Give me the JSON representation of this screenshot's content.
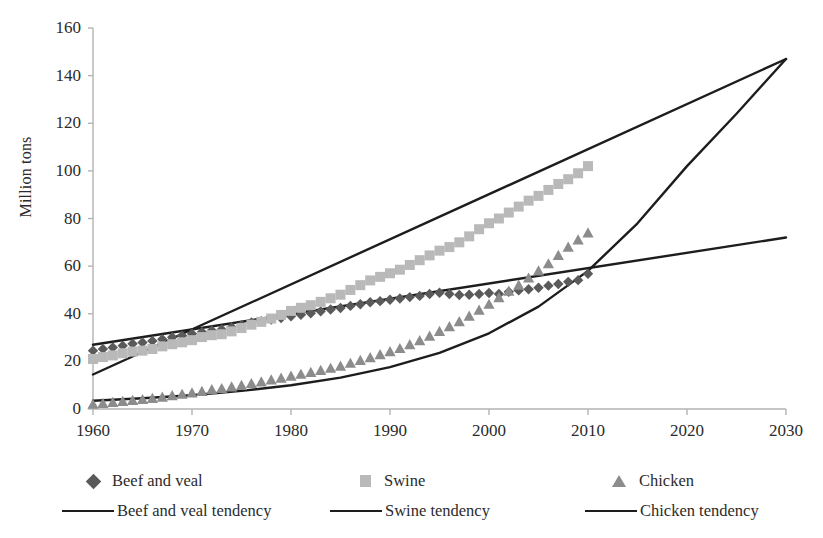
{
  "chart_data": {
    "type": "line",
    "title": "",
    "xlabel": "",
    "ylabel": "Million tons",
    "xlim": [
      1960,
      2030
    ],
    "ylim": [
      0,
      160
    ],
    "xticks": [
      1960,
      1970,
      1980,
      1990,
      2000,
      2010,
      2020,
      2030
    ],
    "yticks": [
      0,
      20,
      40,
      60,
      80,
      100,
      120,
      140,
      160
    ],
    "grid": false,
    "legend_position": "bottom",
    "colors": {
      "beef_marker": "#5a5a5a",
      "swine_marker": "#b9b9b9",
      "chicken_marker": "#8c8c8c",
      "tendency_line": "#1d1d1d",
      "axis": "#b3b3b3",
      "text": "#2b2b2b",
      "background": "#ffffff"
    },
    "x": [
      1960,
      1961,
      1962,
      1963,
      1964,
      1965,
      1966,
      1967,
      1968,
      1969,
      1970,
      1971,
      1972,
      1973,
      1974,
      1975,
      1976,
      1977,
      1978,
      1979,
      1980,
      1981,
      1982,
      1983,
      1984,
      1985,
      1986,
      1987,
      1988,
      1989,
      1990,
      1991,
      1992,
      1993,
      1994,
      1995,
      1996,
      1997,
      1998,
      1999,
      2000,
      2001,
      2002,
      2003,
      2004,
      2005,
      2006,
      2007,
      2008,
      2009,
      2010
    ],
    "series": [
      {
        "name": "Beef and veal",
        "marker": "diamond",
        "color": "#5a5a5a",
        "values": [
          24.5,
          25.2,
          25.8,
          26.6,
          27.4,
          27.9,
          28.6,
          29.3,
          30.1,
          30.8,
          31.6,
          32.3,
          33.0,
          33.4,
          34.3,
          35.2,
          36.3,
          36.9,
          37.6,
          38.2,
          38.9,
          39.6,
          40.2,
          41.0,
          41.8,
          42.4,
          43.3,
          44.0,
          44.8,
          45.3,
          45.9,
          46.4,
          47.0,
          47.5,
          48.3,
          48.8,
          48.3,
          47.9,
          48.0,
          48.3,
          48.7,
          48.3,
          49.2,
          49.8,
          50.3,
          50.9,
          51.8,
          52.5,
          53.4,
          54.1,
          56.8
        ]
      },
      {
        "name": "Swine",
        "marker": "square",
        "color": "#b9b9b9",
        "values": [
          21.0,
          21.8,
          22.5,
          23.4,
          24.1,
          24.5,
          25.2,
          26.3,
          27.2,
          28.0,
          28.9,
          30.2,
          31.0,
          31.4,
          32.6,
          34.0,
          35.4,
          36.6,
          38.0,
          39.5,
          41.2,
          42.5,
          43.6,
          45.0,
          46.5,
          48.0,
          50.0,
          52.0,
          54.0,
          55.5,
          57.0,
          58.5,
          60.5,
          62.5,
          64.5,
          66.5,
          68.0,
          70.0,
          72.5,
          75.5,
          78.0,
          80.0,
          82.5,
          85.0,
          87.5,
          89.5,
          92.0,
          94.5,
          96.5,
          99.0,
          102.0
        ]
      },
      {
        "name": "Chicken",
        "marker": "triangle",
        "color": "#8c8c8c",
        "values": [
          2.0,
          2.4,
          2.8,
          3.2,
          3.6,
          4.0,
          4.5,
          5.0,
          5.6,
          6.2,
          6.8,
          7.4,
          8.1,
          8.6,
          9.3,
          9.9,
          10.7,
          11.4,
          12.2,
          13.0,
          13.8,
          14.6,
          15.4,
          16.2,
          17.1,
          18.0,
          19.2,
          20.4,
          21.6,
          22.8,
          24.1,
          25.4,
          27.0,
          28.7,
          30.6,
          32.6,
          34.6,
          36.7,
          39.0,
          41.5,
          44.0,
          46.8,
          49.5,
          52.0,
          55.0,
          58.0,
          61.0,
          64.5,
          68.0,
          71.0,
          74.0
        ]
      }
    ],
    "tendency_lines": [
      {
        "name": "Beef and veal tendency",
        "type": "linear",
        "color": "#1d1d1d",
        "x_start": 1960,
        "y_start": 27.0,
        "x_end": 2030,
        "y_end": 72.0
      },
      {
        "name": "Swine tendency",
        "type": "linear",
        "color": "#1d1d1d",
        "x_start": 1960,
        "y_start": 14.5,
        "x_end": 2030,
        "y_end": 147.0
      },
      {
        "name": "Chicken tendency",
        "type": "exponential",
        "color": "#1d1d1d",
        "x_start": 1960,
        "y_start": 3.5,
        "x_end": 2030,
        "y_end": 147.0,
        "curve_points": [
          [
            1960,
            3.5
          ],
          [
            1965,
            4.5
          ],
          [
            1970,
            5.8
          ],
          [
            1975,
            7.6
          ],
          [
            1980,
            10.0
          ],
          [
            1985,
            13.2
          ],
          [
            1990,
            17.6
          ],
          [
            1995,
            23.6
          ],
          [
            2000,
            31.8
          ],
          [
            2005,
            43.0
          ],
          [
            2010,
            58.0
          ],
          [
            2015,
            78.0
          ],
          [
            2020,
            102.0
          ],
          [
            2025,
            124.0
          ],
          [
            2030,
            147.0
          ]
        ]
      }
    ]
  },
  "axes": {
    "ylabel": "Million tons",
    "ytick_labels": [
      "160",
      "140",
      "120",
      "100",
      "80",
      "60",
      "40",
      "20",
      "0"
    ],
    "xtick_labels": [
      "1960",
      "1970",
      "1980",
      "1990",
      "2000",
      "2010",
      "2020",
      "2030"
    ]
  },
  "legend": {
    "markers_row": [
      {
        "label": "Beef and veal",
        "marker": "diamond"
      },
      {
        "label": "Swine",
        "marker": "square"
      },
      {
        "label": "Chicken",
        "marker": "triangle"
      }
    ],
    "lines_row": [
      {
        "label": "Beef and veal tendency"
      },
      {
        "label": "Swine tendency"
      },
      {
        "label": "Chicken tendency"
      }
    ]
  }
}
